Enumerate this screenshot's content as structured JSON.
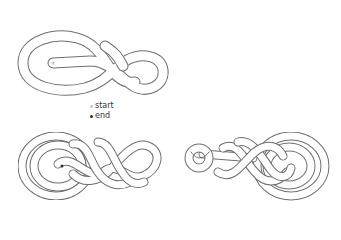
{
  "diagram": {
    "type": "knot-tying-steps",
    "figures": [
      {
        "id": "step-1",
        "description": "Initial loose figure-eight style loop with start end marked"
      },
      {
        "id": "step-2",
        "description": "Tightened multi-pass knot, left orientation with concentric loops"
      },
      {
        "id": "step-3",
        "description": "Finished knot with button end on the left, concentric loops on right"
      }
    ],
    "legend": {
      "items": [
        {
          "label": "start",
          "color": "#c8c8c8"
        },
        {
          "label": "end",
          "color": "#333333"
        }
      ]
    },
    "colors": {
      "rope_outline": "#6e6e6e",
      "rope_fill": "#ffffff",
      "background": "#ffffff"
    }
  }
}
